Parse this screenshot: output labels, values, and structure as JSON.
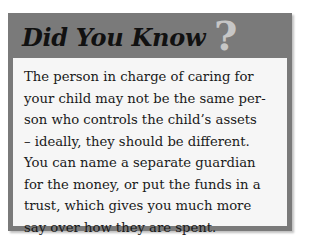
{
  "callout": {
    "title": "Did You Know",
    "icon": "question-mark-icon",
    "icon_glyph": "?",
    "lines": [
      "The person in charge of caring for",
      "your child may not be the same per-",
      "son who controls the child’s assets",
      "– ideally, they should be different.",
      "You can name a separate guardian",
      "for the money, or put the funds in a",
      "trust, which gives you much more",
      "say over how they are spent."
    ],
    "colors": {
      "header_bg": "#7a7a7a",
      "panel_bg": "#f6f6f6",
      "title": "#111111",
      "question_mark": "#c6c6c6",
      "text": "#1a1a1a"
    }
  }
}
